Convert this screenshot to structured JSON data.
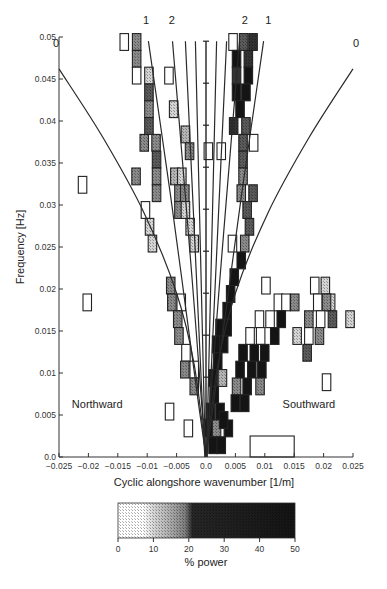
{
  "chart_data": {
    "type": "heatmap",
    "title": "",
    "xlabel": "Cyclic alongshore wavenumber [1/m]",
    "ylabel": "Frequency [Hz]",
    "xlim": [
      -0.025,
      0.025
    ],
    "ylim": [
      0.0,
      0.05
    ],
    "x_ticks": [
      -0.025,
      -0.02,
      -0.015,
      -0.01,
      -0.005,
      0.0,
      0.005,
      0.01,
      0.015,
      0.02,
      0.025
    ],
    "x_tick_labels": [
      "-0.025",
      "-0.02",
      "-0.015",
      "-0.01",
      "-0.005",
      "0.0",
      "0.005",
      "0.01",
      "0.015",
      "0.02",
      "0.025"
    ],
    "y_ticks": [
      0.0,
      0.005,
      0.01,
      0.015,
      0.02,
      0.025,
      0.03,
      0.035,
      0.04,
      0.045,
      0.05
    ],
    "y_tick_labels": [
      "0.0",
      "0.005",
      "0.01",
      "0.015",
      "0.02",
      "0.025",
      "0.03",
      "0.035",
      "0.04",
      "0.045",
      "0.05"
    ],
    "grid": false,
    "annotations": [
      {
        "text": "Northward",
        "x": -0.0185,
        "y": 0.0058
      },
      {
        "text": "Southward",
        "x": 0.0175,
        "y": 0.0058
      },
      {
        "text": "0",
        "x": -0.0255,
        "y": 0.0488,
        "note": "mode 0 edge-wave curve label (left)"
      },
      {
        "text": "0",
        "x": 0.0255,
        "y": 0.0488,
        "note": "mode 0 edge-wave curve label (right)"
      },
      {
        "text": "1",
        "x": -0.0102,
        "y": 0.0515
      },
      {
        "text": "2",
        "x": -0.0058,
        "y": 0.0515
      },
      {
        "text": "2",
        "x": 0.0066,
        "y": 0.0515
      },
      {
        "text": "1",
        "x": 0.0106,
        "y": 0.0515
      }
    ],
    "curves": [
      {
        "name": "mode 0 (northward)",
        "points": [
          [
            -0.025,
            0.0462
          ],
          [
            -0.0175,
            0.038
          ],
          [
            -0.0105,
            0.029
          ],
          [
            -0.005,
            0.0195
          ],
          [
            -0.002,
            0.011
          ],
          [
            0.0,
            0.0
          ]
        ]
      },
      {
        "name": "mode 0 (southward)",
        "points": [
          [
            0.0,
            0.0
          ],
          [
            0.002,
            0.011
          ],
          [
            0.005,
            0.0195
          ],
          [
            0.0105,
            0.029
          ],
          [
            0.0175,
            0.038
          ],
          [
            0.025,
            0.0462
          ]
        ]
      },
      {
        "name": "mode 1 (northward)",
        "points": [
          [
            -0.0098,
            0.0495
          ],
          [
            -0.006,
            0.031
          ],
          [
            -0.0035,
            0.018
          ],
          [
            -0.0012,
            0.006
          ],
          [
            0.0,
            0.0
          ]
        ]
      },
      {
        "name": "mode 2 (northward)",
        "points": [
          [
            -0.0057,
            0.0495
          ],
          [
            -0.0035,
            0.031
          ],
          [
            -0.002,
            0.018
          ],
          [
            -0.0007,
            0.006
          ],
          [
            0.0,
            0.0
          ]
        ]
      },
      {
        "name": "mode 2 (southward)",
        "points": [
          [
            0.0057,
            0.0495
          ],
          [
            0.0035,
            0.031
          ],
          [
            0.002,
            0.018
          ],
          [
            0.0007,
            0.006
          ],
          [
            0.0,
            0.0
          ]
        ]
      },
      {
        "name": "mode 1 (southward)",
        "points": [
          [
            0.0098,
            0.0495
          ],
          [
            0.006,
            0.031
          ],
          [
            0.0035,
            0.018
          ],
          [
            0.0012,
            0.006
          ],
          [
            0.0,
            0.0
          ]
        ]
      },
      {
        "name": "high-mode line L1",
        "points": [
          [
            -0.0035,
            0.0495
          ],
          [
            -0.0002,
            0.0
          ]
        ]
      },
      {
        "name": "high-mode line L2",
        "points": [
          [
            0.0035,
            0.0495
          ],
          [
            0.0002,
            0.0
          ]
        ]
      },
      {
        "name": "high-mode line L3",
        "points": [
          [
            -0.0018,
            0.0495
          ],
          [
            -0.0001,
            0.0
          ]
        ]
      },
      {
        "name": "high-mode line L4",
        "points": [
          [
            0.0018,
            0.0495
          ],
          [
            0.0001,
            0.0
          ]
        ]
      }
    ],
    "vertical_errorbar": {
      "x": 0.0,
      "y_range": [
        0.0,
        0.0495
      ],
      "tick_ys": [
        0.0495,
        0.0445,
        0.0395,
        0.0345,
        0.0295,
        0.0245,
        0.0195,
        0.0145,
        0.0095,
        0.0045
      ]
    },
    "cell_size": {
      "dk": 0.0025,
      "df": 0.002
    },
    "cells": [
      {
        "k": -0.0139,
        "f": 0.0494,
        "p": 3
      },
      {
        "k": -0.0118,
        "f": 0.0494,
        "p": 18
      },
      {
        "k": -0.0118,
        "f": 0.0474,
        "p": 18
      },
      {
        "k": -0.0118,
        "f": 0.0454,
        "p": 4
      },
      {
        "k": -0.0097,
        "f": 0.0454,
        "p": 9
      },
      {
        "k": -0.0097,
        "f": 0.0434,
        "p": 22
      },
      {
        "k": -0.0097,
        "f": 0.0414,
        "p": 17
      },
      {
        "k": -0.0097,
        "f": 0.0394,
        "p": 20
      },
      {
        "k": -0.0105,
        "f": 0.0374,
        "p": 18
      },
      {
        "k": -0.0085,
        "f": 0.0374,
        "p": 18
      },
      {
        "k": -0.0084,
        "f": 0.0354,
        "p": 24
      },
      {
        "k": -0.0119,
        "f": 0.0334,
        "p": 17
      },
      {
        "k": -0.0084,
        "f": 0.0334,
        "p": 19
      },
      {
        "k": -0.0084,
        "f": 0.0314,
        "p": 18
      },
      {
        "k": -0.0103,
        "f": 0.0294,
        "p": 4
      },
      {
        "k": -0.0096,
        "f": 0.0274,
        "p": 9
      },
      {
        "k": -0.0091,
        "f": 0.0254,
        "p": 9
      },
      {
        "k": -0.0063,
        "f": 0.0454,
        "p": 4
      },
      {
        "k": -0.0055,
        "f": 0.0414,
        "p": 11
      },
      {
        "k": -0.0035,
        "f": 0.0384,
        "p": 12
      },
      {
        "k": -0.0028,
        "f": 0.0364,
        "p": 19
      },
      {
        "k": -0.0053,
        "f": 0.0334,
        "p": 14
      },
      {
        "k": -0.0041,
        "f": 0.0334,
        "p": 11
      },
      {
        "k": -0.0046,
        "f": 0.0314,
        "p": 19
      },
      {
        "k": -0.0036,
        "f": 0.0314,
        "p": 19
      },
      {
        "k": -0.0046,
        "f": 0.0294,
        "p": 19
      },
      {
        "k": -0.0035,
        "f": 0.0294,
        "p": 10
      },
      {
        "k": -0.0027,
        "f": 0.0274,
        "p": 9
      },
      {
        "k": -0.002,
        "f": 0.0254,
        "p": 10
      },
      {
        "k": -0.006,
        "f": 0.0204,
        "p": 18
      },
      {
        "k": -0.0058,
        "f": 0.0184,
        "p": 18
      },
      {
        "k": -0.0042,
        "f": 0.0184,
        "p": 3
      },
      {
        "k": -0.0048,
        "f": 0.0164,
        "p": 19
      },
      {
        "k": -0.0046,
        "f": 0.0144,
        "p": 18
      },
      {
        "k": -0.0034,
        "f": 0.0124,
        "p": 4
      },
      {
        "k": -0.0036,
        "f": 0.0104,
        "p": 18
      },
      {
        "k": -0.002,
        "f": 0.0104,
        "p": 3
      },
      {
        "k": -0.002,
        "f": 0.0084,
        "p": 19
      },
      {
        "k": -0.0062,
        "f": 0.0054,
        "p": 0
      },
      {
        "k": -0.003,
        "f": 0.0034,
        "p": 4
      },
      {
        "k": -0.021,
        "f": 0.0324,
        "p": 0
      },
      {
        "k": -0.0202,
        "f": 0.0184,
        "p": 4
      },
      {
        "k": 0.0046,
        "f": 0.0494,
        "p": 1
      },
      {
        "k": 0.0064,
        "f": 0.0494,
        "p": 25
      },
      {
        "k": 0.008,
        "f": 0.0494,
        "p": 28
      },
      {
        "k": 0.0052,
        "f": 0.0474,
        "p": 35
      },
      {
        "k": 0.0072,
        "f": 0.0474,
        "p": 28
      },
      {
        "k": 0.0052,
        "f": 0.0454,
        "p": 30
      },
      {
        "k": 0.0072,
        "f": 0.0454,
        "p": 35
      },
      {
        "k": 0.0052,
        "f": 0.0434,
        "p": 40
      },
      {
        "k": 0.0068,
        "f": 0.0434,
        "p": 40
      },
      {
        "k": 0.0058,
        "f": 0.0414,
        "p": 45
      },
      {
        "k": 0.0047,
        "f": 0.0394,
        "p": 26
      },
      {
        "k": 0.0068,
        "f": 0.0394,
        "p": 22
      },
      {
        "k": 0.0063,
        "f": 0.0374,
        "p": 22
      },
      {
        "k": 0.0081,
        "f": 0.0374,
        "p": 2
      },
      {
        "k": 0.0004,
        "f": 0.0364,
        "p": 3
      },
      {
        "k": 0.0026,
        "f": 0.0364,
        "p": 2
      },
      {
        "k": 0.0063,
        "f": 0.0354,
        "p": 20
      },
      {
        "k": 0.0063,
        "f": 0.0334,
        "p": 19
      },
      {
        "k": 0.006,
        "f": 0.0314,
        "p": 19
      },
      {
        "k": 0.008,
        "f": 0.0314,
        "p": 24
      },
      {
        "k": 0.007,
        "f": 0.0294,
        "p": 21
      },
      {
        "k": 0.0074,
        "f": 0.0274,
        "p": 22
      },
      {
        "k": 0.0066,
        "f": 0.0254,
        "p": 19
      },
      {
        "k": 0.0045,
        "f": 0.0254,
        "p": 4
      },
      {
        "k": 0.006,
        "f": 0.0234,
        "p": 40
      },
      {
        "k": 0.0048,
        "f": 0.0214,
        "p": 45
      },
      {
        "k": 0.0042,
        "f": 0.0194,
        "p": 45
      },
      {
        "k": 0.0036,
        "f": 0.0174,
        "p": 45
      },
      {
        "k": 0.0024,
        "f": 0.0154,
        "p": 45
      },
      {
        "k": 0.0036,
        "f": 0.0154,
        "p": 45
      },
      {
        "k": 0.0018,
        "f": 0.0134,
        "p": 45
      },
      {
        "k": 0.003,
        "f": 0.0134,
        "p": 45
      },
      {
        "k": 0.002,
        "f": 0.0114,
        "p": 45
      },
      {
        "k": 0.0012,
        "f": 0.0094,
        "p": 45
      },
      {
        "k": 0.0028,
        "f": 0.0094,
        "p": 12
      },
      {
        "k": 0.0014,
        "f": 0.0074,
        "p": 45
      },
      {
        "k": 0.0008,
        "f": 0.0054,
        "p": 45
      },
      {
        "k": 0.0024,
        "f": 0.0054,
        "p": 45
      },
      {
        "k": 0.0004,
        "f": 0.0034,
        "p": 45
      },
      {
        "k": 0.0018,
        "f": 0.0034,
        "p": 18
      },
      {
        "k": 0.0038,
        "f": 0.0034,
        "p": 45
      },
      {
        "k": 0.0012,
        "f": 0.0014,
        "p": 45
      },
      {
        "k": 0.0026,
        "f": 0.0014,
        "p": 45
      },
      {
        "k": 0.0102,
        "f": 0.0204,
        "p": 2
      },
      {
        "k": 0.0123,
        "f": 0.0184,
        "p": 4
      },
      {
        "k": 0.0136,
        "f": 0.0184,
        "p": 1
      },
      {
        "k": 0.0151,
        "f": 0.0184,
        "p": 18
      },
      {
        "k": 0.0091,
        "f": 0.0164,
        "p": 3
      },
      {
        "k": 0.0109,
        "f": 0.0164,
        "p": 2
      },
      {
        "k": 0.0128,
        "f": 0.0164,
        "p": 40
      },
      {
        "k": 0.0075,
        "f": 0.0144,
        "p": 5
      },
      {
        "k": 0.0093,
        "f": 0.0144,
        "p": 2
      },
      {
        "k": 0.0117,
        "f": 0.0144,
        "p": 45
      },
      {
        "k": 0.0063,
        "f": 0.0124,
        "p": 45
      },
      {
        "k": 0.0082,
        "f": 0.0124,
        "p": 45
      },
      {
        "k": 0.01,
        "f": 0.0124,
        "p": 45
      },
      {
        "k": 0.0058,
        "f": 0.0104,
        "p": 45
      },
      {
        "k": 0.0078,
        "f": 0.0104,
        "p": 45
      },
      {
        "k": 0.0095,
        "f": 0.0104,
        "p": 45
      },
      {
        "k": 0.0052,
        "f": 0.0084,
        "p": 18
      },
      {
        "k": 0.007,
        "f": 0.0084,
        "p": 45
      },
      {
        "k": 0.0092,
        "f": 0.0084,
        "p": 18
      },
      {
        "k": 0.005,
        "f": 0.0064,
        "p": 45
      },
      {
        "k": 0.0066,
        "f": 0.0064,
        "p": 45
      },
      {
        "k": 0.003,
        "f": 0.0044,
        "p": 45
      },
      {
        "k": 0.0185,
        "f": 0.0204,
        "p": 5
      },
      {
        "k": 0.0203,
        "f": 0.0204,
        "p": 10
      },
      {
        "k": 0.0212,
        "f": 0.0184,
        "p": 8
      },
      {
        "k": 0.019,
        "f": 0.0184,
        "p": 3
      },
      {
        "k": 0.0205,
        "f": 0.0184,
        "p": 19
      },
      {
        "k": 0.0175,
        "f": 0.0164,
        "p": 19
      },
      {
        "k": 0.0195,
        "f": 0.0164,
        "p": 2
      },
      {
        "k": 0.0215,
        "f": 0.0164,
        "p": 24
      },
      {
        "k": 0.0245,
        "f": 0.0164,
        "p": 9
      },
      {
        "k": 0.0155,
        "f": 0.0144,
        "p": 10
      },
      {
        "k": 0.0175,
        "f": 0.0144,
        "p": 2
      },
      {
        "k": 0.0193,
        "f": 0.0144,
        "p": 19
      },
      {
        "k": 0.0172,
        "f": 0.0124,
        "p": 22
      },
      {
        "k": 0.0205,
        "f": 0.0089,
        "p": 0
      }
    ],
    "wide_cells": [
      {
        "k0": 0.0075,
        "k1": 0.015,
        "f0": 0.0,
        "f1": 0.0025,
        "p": 0
      }
    ],
    "colorbar": {
      "label": "% power",
      "range": [
        0,
        50
      ],
      "ticks": [
        0,
        10,
        20,
        30,
        40,
        50
      ],
      "tick_labels": [
        "0",
        "10",
        "20",
        "30",
        "40",
        "50"
      ],
      "colors": {
        "0": "#ffffff",
        "10": "#d8d8d8",
        "20": "#7a7a7a",
        "30": "#1e1e1e",
        "50": "#111111"
      }
    }
  }
}
